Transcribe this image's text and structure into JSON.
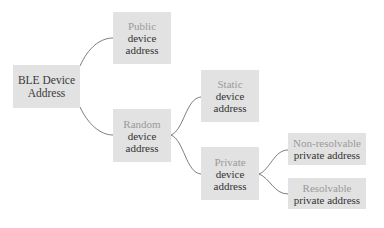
{
  "diagram": {
    "type": "tree",
    "title": "BLE Device Address",
    "colors": {
      "box_fill": "#e2e2e2",
      "primary_text": "#333333",
      "secondary_text": "#9a9a9a",
      "edge": "#6e6e6e",
      "background": "#ffffff"
    },
    "nodes": {
      "root": {
        "line1": "BLE Device",
        "line2": "Address"
      },
      "public": {
        "line1": "Public",
        "line2": "device",
        "line3": "address"
      },
      "random": {
        "line1": "Random",
        "line2": "device",
        "line3": "address"
      },
      "static": {
        "line1": "Static",
        "line2": "device",
        "line3": "address"
      },
      "private": {
        "line1": "Private",
        "line2": "device",
        "line3": "address"
      },
      "non_resolvable": {
        "line1": "Non-resolvable",
        "line2": "private address"
      },
      "resolvable": {
        "line1": "Resolvable",
        "line2": "private address"
      }
    },
    "edges": [
      {
        "from": "root",
        "to": "public"
      },
      {
        "from": "root",
        "to": "random"
      },
      {
        "from": "random",
        "to": "static"
      },
      {
        "from": "random",
        "to": "private"
      },
      {
        "from": "private",
        "to": "non_resolvable"
      },
      {
        "from": "private",
        "to": "resolvable"
      }
    ]
  }
}
